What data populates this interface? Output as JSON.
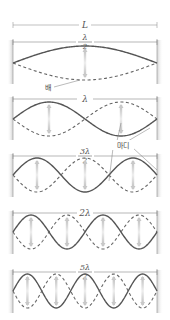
{
  "diagram": {
    "length_label": "L",
    "antinode_label": "배",
    "node_label": "마디",
    "colors": {
      "solid_wave": "#555555",
      "dashed_wave": "#666666",
      "arrow": "#c8c8c8",
      "wall": "#d0d0d0",
      "dimension_line": "#888888"
    },
    "panels": [
      {
        "harmonic": 1,
        "length_label_num": "λ",
        "length_label_den": "2",
        "length_text": "λ/2",
        "half_waves": 1
      },
      {
        "harmonic": 2,
        "length_label_num": "λ",
        "length_label_den": "",
        "length_text": "λ",
        "half_waves": 2
      },
      {
        "harmonic": 3,
        "length_label_num": "3λ",
        "length_label_den": "2",
        "length_text": "3λ/2",
        "half_waves": 3
      },
      {
        "harmonic": 4,
        "length_label_num": "2λ",
        "length_label_den": "",
        "length_text": "2λ",
        "half_waves": 4
      },
      {
        "harmonic": 5,
        "length_label_num": "5λ",
        "length_label_den": "2",
        "length_text": "5λ/2",
        "half_waves": 5
      }
    ]
  }
}
